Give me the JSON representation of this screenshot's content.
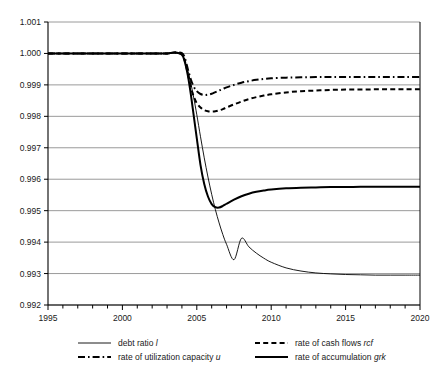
{
  "chart_data": {
    "type": "line",
    "title": "",
    "xlabel": "",
    "ylabel": "",
    "xlim": [
      1995,
      2020
    ],
    "ylim": [
      0.992,
      1.001
    ],
    "grid": true,
    "legend_position": "bottom",
    "x_ticks": [
      1995,
      2000,
      2005,
      2010,
      2015,
      2020
    ],
    "x_minor_tick_step": 1,
    "y_ticks": [
      0.992,
      0.993,
      0.994,
      0.995,
      0.996,
      0.997,
      0.998,
      0.999,
      1.0,
      1.001
    ],
    "y_tick_labels": [
      "0.992",
      "0.993",
      "0.994",
      "0.995",
      "0.996",
      "0.997",
      "0.998",
      "0.999",
      "1.000",
      "1.001"
    ],
    "x": [
      1995,
      1996,
      1997,
      1998,
      1999,
      2000,
      2001,
      2002,
      2003,
      2003.5,
      2004,
      2004.2,
      2004.4,
      2004.6,
      2004.8,
      2005,
      2005.25,
      2005.5,
      2005.75,
      2006,
      2006.25,
      2006.5,
      2006.75,
      2007,
      2007.5,
      2008,
      2008.5,
      2009,
      2009.5,
      2010,
      2011,
      2012,
      2013,
      2014,
      2015,
      2016,
      2017,
      2018,
      2019,
      2020
    ],
    "series": [
      {
        "name": "debt ratio l",
        "key": "l",
        "style": "solid-thin",
        "values": [
          1.0,
          1.0,
          1.0,
          1.0,
          1.0,
          1.0,
          1.0,
          1.0,
          1.0,
          1.00002,
          0.99995,
          0.99975,
          0.99945,
          0.99905,
          0.99858,
          0.99805,
          0.99735,
          0.99668,
          0.99607,
          0.99552,
          0.99503,
          0.99461,
          0.99424,
          0.99393,
          0.99344,
          0.99412,
          0.99385,
          0.99365,
          0.99349,
          0.99336,
          0.99318,
          0.99308,
          0.99302,
          0.99299,
          0.99297,
          0.99296,
          0.99295,
          0.99295,
          0.99295,
          0.99295
        ]
      },
      {
        "name": "rate of cash flows rcf",
        "key": "rcf",
        "style": "dashed",
        "values": [
          1.0,
          1.0,
          1.0,
          1.0,
          1.0,
          1.0,
          1.0,
          1.0,
          1.0,
          1.00003,
          0.99999,
          0.99975,
          0.99935,
          0.99893,
          0.99862,
          0.99842,
          0.99828,
          0.9982,
          0.99816,
          0.99815,
          0.99816,
          0.99819,
          0.99823,
          0.99828,
          0.99838,
          0.99847,
          0.99855,
          0.99861,
          0.99866,
          0.9987,
          0.99876,
          0.9988,
          0.99882,
          0.99884,
          0.99885,
          0.99885,
          0.99886,
          0.99886,
          0.99886,
          0.99886
        ]
      },
      {
        "name": "rate of utilization capacity u",
        "key": "u",
        "style": "dash-dot",
        "values": [
          1.0,
          1.0,
          1.0,
          1.0,
          1.0,
          1.0,
          1.0,
          1.0,
          1.0,
          1.00003,
          1.00001,
          0.99985,
          0.9995,
          0.99917,
          0.99894,
          0.9988,
          0.99871,
          0.99868,
          0.99869,
          0.99872,
          0.99877,
          0.99882,
          0.99887,
          0.99892,
          0.999,
          0.99907,
          0.99912,
          0.99916,
          0.99919,
          0.99921,
          0.99923,
          0.99924,
          0.99925,
          0.99925,
          0.99925,
          0.99925,
          0.99925,
          0.99925,
          0.99925,
          0.99925
        ]
      },
      {
        "name": "rate of accumulation grk",
        "key": "grk",
        "style": "solid-thick",
        "values": [
          1.0,
          1.0,
          1.0,
          1.0,
          1.0,
          1.0,
          1.0,
          1.0,
          1.0,
          1.00003,
          0.99996,
          0.99972,
          0.9993,
          0.9987,
          0.998,
          0.9973,
          0.99645,
          0.99585,
          0.99545,
          0.99521,
          0.99511,
          0.9951,
          0.99515,
          0.99522,
          0.99535,
          0.99546,
          0.99554,
          0.9956,
          0.99564,
          0.99567,
          0.99571,
          0.99573,
          0.99574,
          0.99575,
          0.99575,
          0.99576,
          0.99576,
          0.99576,
          0.99576,
          0.99576
        ]
      }
    ]
  },
  "legend": {
    "items": [
      {
        "label": "debt ratio ",
        "italic": "l",
        "style": "solid-thin"
      },
      {
        "label": "rate of cash flows ",
        "italic": "rcf",
        "style": "dashed"
      },
      {
        "label": "rate of utilization capacity ",
        "italic": "u",
        "style": "dash-dot"
      },
      {
        "label": "rate of accumulation ",
        "italic": "grk",
        "style": "solid-thick"
      }
    ]
  },
  "colors": {
    "axis": "#000000",
    "grid": "#808080",
    "series": "#000000",
    "background": "#ffffff"
  }
}
